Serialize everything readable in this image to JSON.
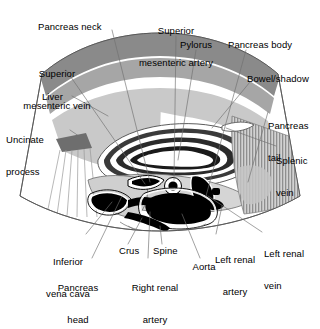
{
  "figure": {
    "type": "labeled-anatomical-diagram",
    "modality": "ultrasound-sector-scan"
  },
  "colors": {
    "background": "#ffffff",
    "ink": "#000000",
    "leader_line": "#777777",
    "band_dark": "#8a8a8a",
    "band_mid": "#a6a6a6",
    "tissue_light": "#c9c9c9",
    "tissue_pale": "#d8d8d8",
    "hatch_gray": "#9a9a9a",
    "vessel_black": "#000000",
    "outline": "#555555"
  },
  "labels": [
    {
      "id": "pancreas-neck",
      "text": "Pancreas neck",
      "lines": [
        "Pancreas neck"
      ],
      "x": 38,
      "y": 22,
      "align": "lt"
    },
    {
      "id": "superior-mesenteric-artery",
      "text": "Superior mesenteric artery",
      "lines": [
        "Superior",
        "mesenteric artery"
      ],
      "x": 128,
      "y": 5,
      "align": "ctr"
    },
    {
      "id": "pylorus",
      "text": "Pylorus",
      "lines": [
        "Pylorus"
      ],
      "x": 180,
      "y": 40,
      "align": "lt"
    },
    {
      "id": "pancreas-body",
      "text": "Pancreas body",
      "lines": [
        "Pancreas body"
      ],
      "x": 228,
      "y": 40,
      "align": "lt"
    },
    {
      "id": "superior-mesenteric-vein",
      "text": "Superior mesenteric vein",
      "lines": [
        "Superior",
        "mesenteric vein"
      ],
      "x": 16,
      "y": 48,
      "align": "ctr"
    },
    {
      "id": "bowel-shadow",
      "text": "Bowel/shadow",
      "lines": [
        "Bowel/shadow"
      ],
      "x": 247,
      "y": 74,
      "align": "lt"
    },
    {
      "id": "liver",
      "text": "Liver",
      "lines": [
        "Liver"
      ],
      "x": 42,
      "y": 92,
      "align": "lt"
    },
    {
      "id": "pancreas-tail",
      "text": "Pancreas tail",
      "lines": [
        "Pancreas",
        "tail"
      ],
      "x": 268,
      "y": 100,
      "align": "lt"
    },
    {
      "id": "uncinate-process",
      "text": "Uncinate process",
      "lines": [
        "Uncinate",
        "process"
      ],
      "x": 8,
      "y": 116,
      "align": "lt"
    },
    {
      "id": "splenic-vein",
      "text": "Splenic vein",
      "lines": [
        "Splenic",
        "vein"
      ],
      "x": 276,
      "y": 135,
      "align": "lt"
    },
    {
      "id": "inferior-vena-cava",
      "text": "Inferior vena cava",
      "lines": [
        "Inferior",
        "vena cava"
      ],
      "x": 62,
      "y": 238,
      "align": "ctr"
    },
    {
      "id": "crus",
      "text": "Crus",
      "lines": [
        "Crus"
      ],
      "x": 121,
      "y": 249,
      "align": "lt"
    },
    {
      "id": "spine",
      "text": "Spine",
      "lines": [
        "Spine"
      ],
      "x": 153,
      "y": 249,
      "align": "lt"
    },
    {
      "id": "left-renal-artery",
      "text": "Left renal artery",
      "lines": [
        "Left renal",
        "artery"
      ],
      "x": 200,
      "y": 238,
      "align": "ctr"
    },
    {
      "id": "left-renal-vein",
      "text": "Left renal vein",
      "lines": [
        "Left renal",
        "vein"
      ],
      "x": 265,
      "y": 230,
      "align": "ctr"
    },
    {
      "id": "pancreas-head",
      "text": "Pancreas head",
      "lines": [
        "Pancreas",
        "head"
      ],
      "x": 65,
      "y": 264,
      "align": "ctr"
    },
    {
      "id": "right-renal-artery",
      "text": "Right renal artery",
      "lines": [
        "Right renal",
        "artery"
      ],
      "x": 141,
      "y": 264,
      "align": "ctr"
    },
    {
      "id": "aorta",
      "text": "Aorta",
      "lines": [
        "Aorta"
      ],
      "x": 196,
      "y": 264,
      "align": "ctr"
    }
  ],
  "structures": [
    "anterior abdominal wall band",
    "liver parenchyma",
    "uncinate process",
    "acoustic shadow rays",
    "pylorus / stomach wall bands",
    "pancreas body and tail",
    "bowel gas shadow hatching",
    "splenic vein",
    "superior mesenteric vein",
    "superior mesenteric artery",
    "inferior vena cava",
    "aorta",
    "left renal vein",
    "left renal artery",
    "right renal artery",
    "crus of diaphragm",
    "vertebral body / spine"
  ]
}
